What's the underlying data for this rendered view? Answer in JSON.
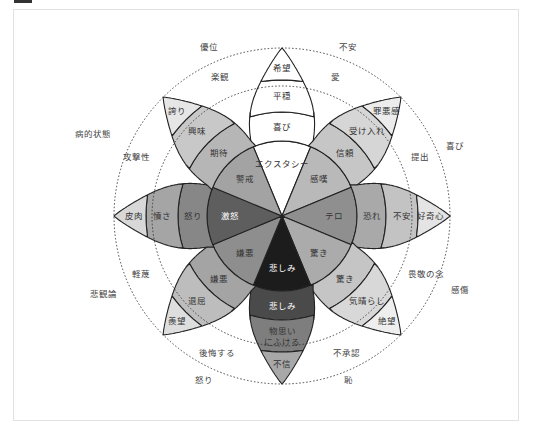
{
  "header": {
    "bar_color": "#333333"
  },
  "diagram": {
    "title": "",
    "center": [
      282,
      216
    ],
    "colors": {
      "stroke": "#222222",
      "dotted_circle": "#333333"
    },
    "petals": [
      {
        "name": "joy",
        "angle": -90,
        "bands": [
          "エクスタシー",
          "喜び",
          "平穏",
          "希望"
        ],
        "colors": [
          "#ffffff",
          "#ffffff",
          "#ffffff",
          "#ffffff"
        ]
      },
      {
        "name": "trust",
        "angle": -45,
        "bands": [
          "感嘆",
          "信頼",
          "受け入れ",
          "罪悪感"
        ],
        "colors": [
          "#b9b9b9",
          "#c6c6c6",
          "#d6d6d6",
          "#ececec"
        ]
      },
      {
        "name": "fear",
        "angle": 0,
        "bands": [
          "テロ",
          "恐れ",
          "不安",
          "好奇心"
        ],
        "colors": [
          "#8f8f8f",
          "#a9a9a9",
          "#c3c3c3",
          "#e4e4e4"
        ]
      },
      {
        "name": "surprise",
        "angle": 45,
        "bands": [
          "驚き",
          "驚き",
          "気晴らし",
          "絶望"
        ],
        "colors": [
          "#ababab",
          "#c5c5c5",
          "#d8d8d8",
          "#eeeeee"
        ]
      },
      {
        "name": "sadness",
        "angle": 90,
        "bands": [
          "悲しみ",
          "悲しみ",
          "物思い\nにふける",
          "不信"
        ],
        "colors": [
          "#1c1c1c",
          "#4a4a4a",
          "#7e7e7e",
          "#a8a8a8"
        ]
      },
      {
        "name": "disgust",
        "angle": 135,
        "bands": [
          "嫌悪",
          "嫌悪",
          "退屈",
          "羨望"
        ],
        "colors": [
          "#8e8e8e",
          "#a4a4a4",
          "#bdbdbd",
          "#dedede"
        ]
      },
      {
        "name": "anger",
        "angle": 180,
        "bands": [
          "激怒",
          "怒り",
          "憤さ",
          "皮肉"
        ],
        "colors": [
          "#5e5e5e",
          "#878787",
          "#a5a5a5",
          "#d8d8d8"
        ]
      },
      {
        "name": "anticipation",
        "angle": -135,
        "bands": [
          "警戒",
          "期待",
          "興味",
          "誇り"
        ],
        "colors": [
          "#a3a3a3",
          "#b6b6b6",
          "#c8c8c8",
          "#e6e6e6"
        ]
      }
    ],
    "outer_labels": [
      {
        "text": "優位",
        "x": 209,
        "y": 47
      },
      {
        "text": "不安",
        "x": 348,
        "y": 47
      },
      {
        "text": "楽観",
        "x": 220,
        "y": 77
      },
      {
        "text": "愛",
        "x": 335,
        "y": 77
      },
      {
        "text": "病的状態",
        "x": 93,
        "y": 134
      },
      {
        "text": "攻撃性",
        "x": 136,
        "y": 157
      },
      {
        "text": "喜び",
        "x": 455,
        "y": 146
      },
      {
        "text": "提出",
        "x": 420,
        "y": 157
      },
      {
        "text": "畏敬の念",
        "x": 426,
        "y": 274
      },
      {
        "text": "感傷",
        "x": 460,
        "y": 290
      },
      {
        "text": "軽蔑",
        "x": 141,
        "y": 274
      },
      {
        "text": "悲観論",
        "x": 103,
        "y": 294
      },
      {
        "text": "後悔する",
        "x": 217,
        "y": 353
      },
      {
        "text": "不承認",
        "x": 346,
        "y": 353
      },
      {
        "text": "怒り",
        "x": 204,
        "y": 380
      },
      {
        "text": "恥",
        "x": 348,
        "y": 380
      }
    ]
  }
}
